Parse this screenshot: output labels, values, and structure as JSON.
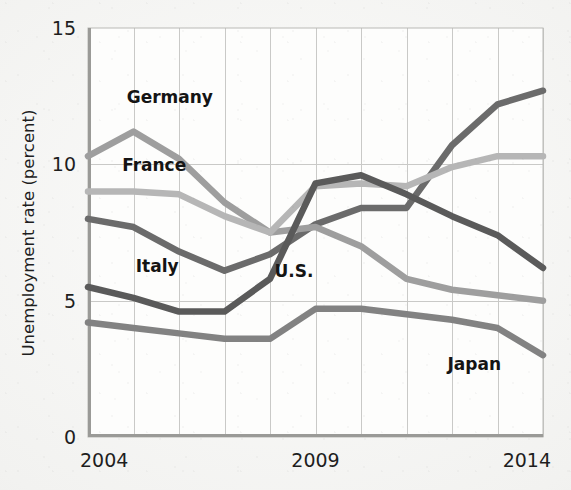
{
  "chart_data": {
    "type": "line",
    "title": "",
    "xlabel": "",
    "ylabel": "Unemployment rate (percent)",
    "xlim": [
      2004,
      2014
    ],
    "ylim": [
      0,
      15
    ],
    "x": [
      2004,
      2005,
      2006,
      2007,
      2008,
      2009,
      2010,
      2011,
      2012,
      2013,
      2014
    ],
    "x_tick_labels": [
      "2004",
      "2009",
      "2014"
    ],
    "x_ticks": [
      2004,
      2009,
      2014
    ],
    "y_ticks": [
      0,
      5,
      10,
      15
    ],
    "y_tick_labels": [
      "0",
      "5",
      "10",
      "15"
    ],
    "grid": "both-axes-minor-vertical-every-year",
    "legend": "inline-labels-on-plot",
    "series": [
      {
        "name": "Italy",
        "color": "#6b6b6b",
        "width": 6.5,
        "label_x": 2005.05,
        "label_y": 6.05,
        "values": [
          8.0,
          7.7,
          6.8,
          6.1,
          6.7,
          7.8,
          8.4,
          8.4,
          10.7,
          12.2,
          12.7
        ]
      },
      {
        "name": "Germany",
        "color": "#9e9e9e",
        "width": 6.5,
        "label_x": 2004.85,
        "label_y": 12.25,
        "values": [
          10.3,
          11.2,
          10.2,
          8.6,
          7.5,
          7.7,
          7.0,
          5.8,
          5.4,
          5.2,
          5.0
        ]
      },
      {
        "name": "France",
        "color": "#b6b6b6",
        "width": 6.5,
        "label_x": 2004.75,
        "label_y": 9.75,
        "values": [
          9.0,
          9.0,
          8.9,
          8.1,
          7.5,
          9.2,
          9.3,
          9.2,
          9.9,
          10.3,
          10.3
        ]
      },
      {
        "name": "U.S.",
        "color": "#5a5a5a",
        "width": 6.5,
        "label_x": 2008.1,
        "label_y": 5.85,
        "values": [
          5.5,
          5.1,
          4.6,
          4.6,
          5.8,
          9.3,
          9.6,
          8.9,
          8.1,
          7.4,
          6.2
        ]
      },
      {
        "name": "Japan",
        "color": "#828282",
        "width": 6.5,
        "label_x": 2011.9,
        "label_y": 2.45,
        "values": [
          4.2,
          4.0,
          3.8,
          3.6,
          3.6,
          4.7,
          4.7,
          4.5,
          4.3,
          4.0,
          3.0
        ]
      }
    ]
  },
  "figure": {
    "series_order": [
      "Italy",
      "Germany",
      "France",
      "U.S.",
      "Japan"
    ]
  }
}
